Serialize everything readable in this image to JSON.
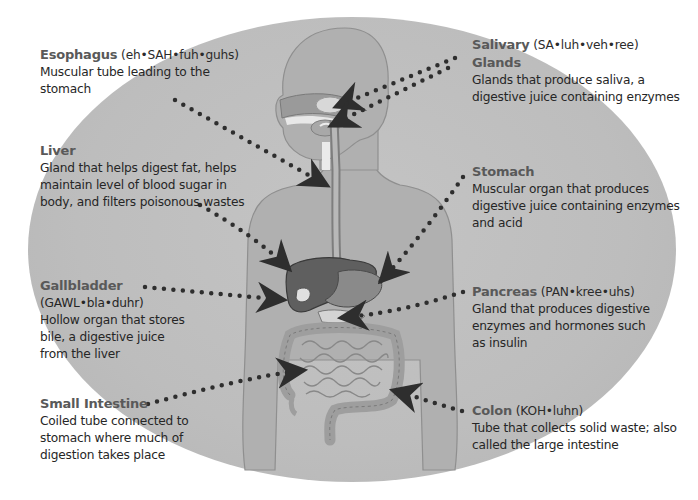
{
  "diagram": {
    "colors": {
      "background": "#ffffff",
      "ellipse": "#bdbdbd",
      "title_text": "#595959",
      "body_text": "#262626",
      "dots": "#2e2e2e"
    },
    "labels": {
      "esophagus": {
        "title": "Esophagus",
        "pronunciation": "(eh•SAH•fuh•guhs)",
        "description": "Muscular tube leading to the stomach"
      },
      "liver": {
        "title": "Liver",
        "pronunciation": "",
        "description": "Gland that helps digest fat, helps maintain level of blood sugar in body, and filters poisonous wastes"
      },
      "gallbladder": {
        "title": "Gallbladder",
        "pronunciation": "(GAWL•bla•duhr)",
        "description": "Hollow organ that stores bile, a digestive juice from the liver"
      },
      "small_intestine": {
        "title": "Small Intestine",
        "pronunciation": "",
        "description": "Coiled tube connected to stomach where much of digestion takes place"
      },
      "salivary_glands": {
        "title": "Salivary",
        "pronunciation": "(SA•luh•veh•ree)",
        "title2": "Glands",
        "description": "Glands that produce saliva, a digestive juice containing enzymes"
      },
      "stomach": {
        "title": "Stomach",
        "pronunciation": "",
        "description": "Muscular organ that produces digestive juice containing enzymes and acid"
      },
      "pancreas": {
        "title": "Pancreas",
        "pronunciation": "(PAN•kree•uhs)",
        "description": "Gland that produces digestive enzymes and hormones such as insulin"
      },
      "colon": {
        "title": "Colon",
        "pronunciation": "(KOH•luhn)",
        "description": "Tube that collects solid waste; also called the large intestine"
      }
    }
  }
}
